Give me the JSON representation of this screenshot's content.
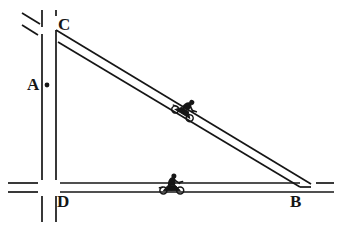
{
  "diagram": {
    "type": "line-diagram",
    "width": 341,
    "height": 228,
    "background_color": "#ffffff",
    "line_color": "#161616",
    "labels": [
      {
        "id": "A",
        "text": "A",
        "x": 27,
        "y": 76,
        "note": "point marker on vertical road between C and D"
      },
      {
        "id": "C",
        "text": "C",
        "x": 58,
        "y": 16,
        "note": "top vertex / intersection of vertical road and diagonal road"
      },
      {
        "id": "D",
        "text": "D",
        "x": 57,
        "y": 193,
        "note": "bottom-left vertex / crossroads of vertical and horizontal road"
      },
      {
        "id": "B",
        "text": "B",
        "x": 290,
        "y": 193,
        "note": "bottom-right vertex / merge of diagonal road into horizontal road"
      }
    ],
    "point_markers": [
      {
        "id": "A-dot",
        "x": 47,
        "y": 85,
        "radius": 2.4,
        "label": "A"
      }
    ],
    "roads": [
      {
        "id": "vertical-road",
        "name": "road-CD",
        "orientation": "vertical",
        "from": "C",
        "to": "D",
        "edge_left_x": 42,
        "edge_right_x": 56,
        "top_y": 10,
        "bottom_y": 222
      },
      {
        "id": "horizontal-road",
        "name": "road-DB",
        "orientation": "horizontal",
        "from": "D",
        "to": "B",
        "edge_top_y": 183,
        "edge_bottom_y": 192,
        "left_x": 8,
        "right_x": 334
      },
      {
        "id": "diagonal-road",
        "name": "road-CB",
        "orientation": "diagonal",
        "from": "C",
        "to": "B",
        "start_x": 28,
        "start_y": 14,
        "end_x": 312,
        "end_y": 186,
        "note": "hypotenuse of the right triangle"
      }
    ],
    "vehicles": [
      {
        "id": "motorcycle-on-diagonal",
        "name": "motorcycle-diagonal",
        "x": 185,
        "y": 110,
        "rotation_deg": 31,
        "road": "diagonal-road"
      },
      {
        "id": "motorcycle-on-horizontal",
        "name": "motorcycle-horizontal",
        "x": 172,
        "y": 188,
        "rotation_deg": 0,
        "road": "horizontal-road"
      }
    ]
  }
}
